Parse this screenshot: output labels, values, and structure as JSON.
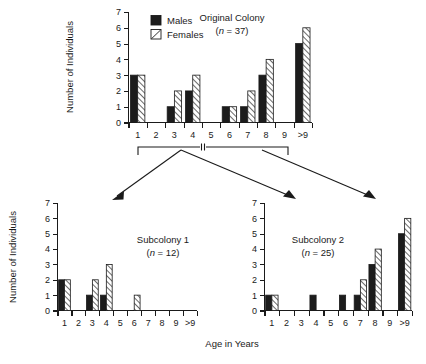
{
  "figure": {
    "shared_ylabel": "Number of Individuals",
    "shared_xlabel": "Age in Years",
    "legend": {
      "males_label": "Males",
      "females_label": "Females",
      "males_swatch": "solid-black-square",
      "females_swatch": "hatched-white-square"
    },
    "colors": {
      "ink": "#1a1a1a",
      "males_fill": "#1c1c1c",
      "females_fill": "#ffffff",
      "background": "#ffffff"
    }
  },
  "chart_data": [
    {
      "type": "bar",
      "id": "original-colony",
      "title": "Original  Colony",
      "subtitle": "(n = 37)",
      "n_prefix": "(",
      "n_symbol": "n",
      "n_value": " = 37)",
      "xlabel": "Age in Years",
      "ylabel": "Number of Individuals",
      "categories": [
        "1",
        "2",
        "3",
        "4",
        "5",
        "6",
        "7",
        "8",
        "9",
        ">9"
      ],
      "ylim": [
        0,
        7
      ],
      "yticks": [
        0,
        1,
        2,
        3,
        4,
        5,
        6,
        7
      ],
      "grid": false,
      "legend_position": "top-left-inside",
      "series": [
        {
          "name": "Males",
          "values": [
            3,
            0,
            1,
            2,
            0,
            1,
            1,
            3,
            0,
            5
          ]
        },
        {
          "name": "Females",
          "values": [
            3,
            0,
            2,
            3,
            0,
            1,
            2,
            4,
            0,
            6
          ]
        }
      ]
    },
    {
      "type": "bar",
      "id": "subcolony-1",
      "title": "Subcolony  1",
      "subtitle": "(n = 12)",
      "n_prefix": "(",
      "n_symbol": "n",
      "n_value": " = 12)",
      "xlabel": "Age in Years",
      "ylabel": "Number of Individuals",
      "categories": [
        "1",
        "2",
        "3",
        "4",
        "5",
        "6",
        "7",
        "8",
        "9",
        ">9"
      ],
      "ylim": [
        0,
        7
      ],
      "yticks": [
        0,
        1,
        2,
        3,
        4,
        5,
        6,
        7
      ],
      "grid": false,
      "series": [
        {
          "name": "Males",
          "values": [
            2,
            0,
            1,
            1,
            0,
            0,
            0,
            0,
            0,
            0
          ]
        },
        {
          "name": "Females",
          "values": [
            2,
            0,
            2,
            3,
            0,
            1,
            0,
            0,
            0,
            0
          ]
        }
      ]
    },
    {
      "type": "bar",
      "id": "subcolony-2",
      "title": "Subcolony  2",
      "subtitle": "(n = 25)",
      "n_prefix": "(",
      "n_symbol": "n",
      "n_value": " = 25)",
      "xlabel": "Age in Years",
      "ylabel": "Number of Individuals",
      "categories": [
        "1",
        "2",
        "3",
        "4",
        "5",
        "6",
        "7",
        "8",
        "9",
        ">9"
      ],
      "ylim": [
        0,
        7
      ],
      "yticks": [
        0,
        1,
        2,
        3,
        4,
        5,
        6,
        7
      ],
      "grid": false,
      "series": [
        {
          "name": "Males",
          "values": [
            1,
            0,
            0,
            1,
            0,
            1,
            1,
            3,
            0,
            5
          ]
        },
        {
          "name": "Females",
          "values": [
            1,
            0,
            0,
            0,
            0,
            0,
            2,
            4,
            0,
            6
          ]
        }
      ]
    }
  ]
}
